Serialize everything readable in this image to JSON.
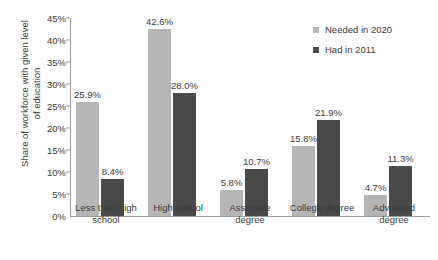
{
  "chart_data": {
    "type": "bar",
    "title": "",
    "xlabel": "",
    "ylabel": "Share of workforce with given level of education",
    "ylim": [
      0,
      45
    ],
    "ytick_labels": [
      "0%",
      "5%",
      "10%",
      "15%",
      "20%",
      "25%",
      "30%",
      "35%",
      "40%",
      "45%"
    ],
    "ytick_values": [
      0,
      5,
      10,
      15,
      20,
      25,
      30,
      35,
      40,
      45
    ],
    "grid": false,
    "legend_position": "top-right",
    "categories": [
      "Less than high school",
      "High school",
      "Associate degree",
      "College degree",
      "Advanced degree"
    ],
    "series": [
      {
        "name": "Needed in 2020",
        "color": "#b5b5b5",
        "values": [
          25.9,
          42.6,
          5.8,
          15.8,
          4.7
        ],
        "labels": [
          "25.9%",
          "42.6%",
          "5.8%",
          "15.8%",
          "4.7%"
        ]
      },
      {
        "name": "Had in 2011",
        "color": "#4a4a4a",
        "values": [
          8.4,
          28.0,
          10.7,
          21.9,
          11.3
        ],
        "labels": [
          "8.4%",
          "28.0%",
          "10.7%",
          "21.9%",
          "11.3%"
        ]
      }
    ]
  },
  "axis": {
    "y_title_line1": "Share of workforce with given level",
    "y_title_line2": "of education"
  },
  "colors": {
    "series_needed": "#b5b5b5",
    "series_had": "#4a4a4a",
    "axis": "#9a9a9a",
    "text": "#3b3b3b",
    "background": "#ffffff"
  }
}
